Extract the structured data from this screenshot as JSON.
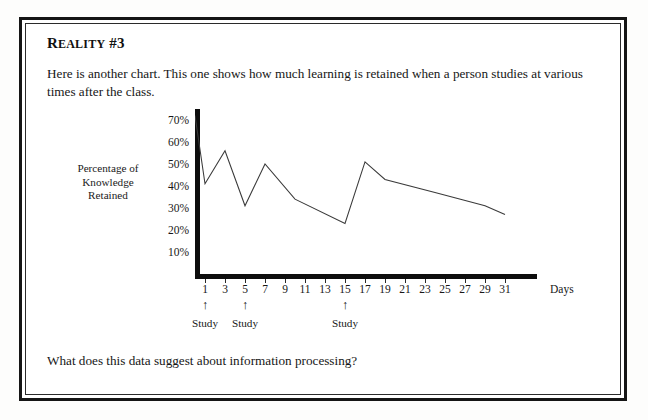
{
  "page": {
    "heading_lead": "R",
    "heading_small": "EALITY",
    "heading_tail": " #3",
    "heading_full": "REALITY #3",
    "paragraph": "Here is another chart.  This one shows how much learning is retained when a person studies at various times after the class.",
    "question": "What does this data suggest about information processing?"
  },
  "chart_data": {
    "type": "line",
    "title": "",
    "xlabel": "Days",
    "ylabel": "Percentage of Knowledge Retained",
    "ylabel_lines": [
      "Percentage of",
      "Knowledge",
      "Retained"
    ],
    "grid": false,
    "legend": "none",
    "xlim": [
      0,
      33
    ],
    "ylim": [
      0,
      75
    ],
    "ytick_labels": [
      "70%",
      "60%",
      "50%",
      "40%",
      "30%",
      "20%",
      "10%"
    ],
    "ytick_values": [
      70,
      60,
      50,
      40,
      30,
      20,
      10
    ],
    "xtick_labels": [
      "1",
      "3",
      "5",
      "7",
      "9",
      "11",
      "13",
      "15",
      "17",
      "19",
      "21",
      "23",
      "25",
      "27",
      "29",
      "31"
    ],
    "xtick_values": [
      1,
      3,
      5,
      7,
      9,
      11,
      13,
      15,
      17,
      19,
      21,
      23,
      25,
      27,
      29,
      31
    ],
    "x": [
      0,
      1,
      3,
      5,
      7,
      10,
      15,
      17,
      19,
      24,
      29,
      31
    ],
    "values": [
      72,
      41,
      56,
      31,
      50,
      34,
      23,
      51,
      43,
      37,
      31,
      27
    ],
    "annotations": [
      {
        "label": "Study",
        "marker": "up-arrow",
        "x": 1
      },
      {
        "label": "Study",
        "marker": "up-arrow",
        "x": 5
      },
      {
        "label": "Study",
        "marker": "up-arrow",
        "x": 15
      }
    ],
    "line_color": "#3a3a3a",
    "axis_color": "#0d0d0d"
  }
}
